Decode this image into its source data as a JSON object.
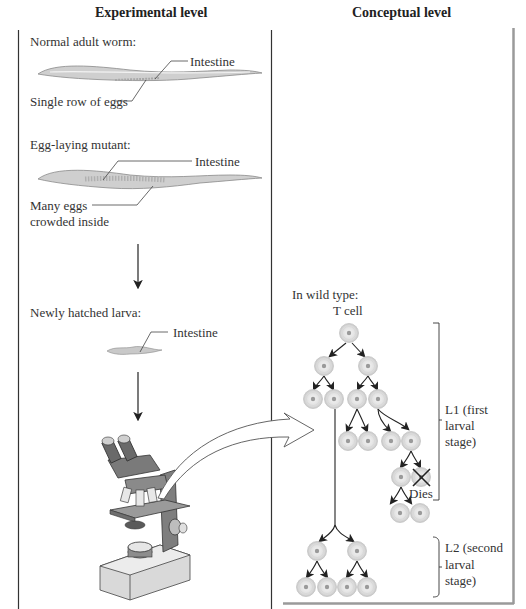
{
  "headers": {
    "experimental": "Experimental level",
    "conceptual": "Conceptual level"
  },
  "experimental": {
    "normal_worm": {
      "title": "Normal adult worm:",
      "label_intestine": "Intestine",
      "label_eggs": "Single row of eggs"
    },
    "mutant_worm": {
      "title": "Egg-laying mutant:",
      "label_intestine": "Intestine",
      "label_eggs_line1": "Many eggs",
      "label_eggs_line2": "crowded inside"
    },
    "larva": {
      "title": "Newly hatched larva:",
      "label_intestine": "Intestine"
    },
    "microscope": "microscope-illustration"
  },
  "conceptual": {
    "title": "In wild type:",
    "root_cell": "T cell",
    "death_label": "Dies",
    "stages": [
      {
        "line1": "L1 (first",
        "line2": "larval",
        "line3": "stage)"
      },
      {
        "line1": "L2 (second",
        "line2": "larval",
        "line3": "stage)"
      }
    ]
  },
  "colors": {
    "line": "#222222",
    "cell_fill": "#e2e2e2",
    "cell_nucleus": "#9a9a9a",
    "frame_gray": "#9a9a9a",
    "worm_fill": "#c9c9c9"
  }
}
